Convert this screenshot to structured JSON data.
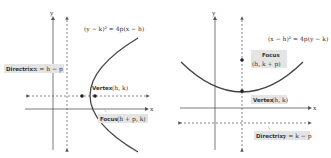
{
  "left_panel": {
    "axis_x": "x",
    "axis_y": "y",
    "equation": "(y − k)² = 4p(x − h)",
    "directrix_label": "Directrix:",
    "directrix_eq": "x = h − p",
    "vertex_label": "Vertex",
    "vertex_coords": "(h, k)",
    "focus_label": "Focus",
    "focus_coords": "(h + p, k)"
  },
  "right_panel": {
    "axis_x": "x",
    "axis_y": "y",
    "equation": "(x − h)² = 4p(y − k)",
    "focus_label": "Focus",
    "focus_coords": "(h, k + p)",
    "vertex_label": "Vertex",
    "vertex_coords": "(h, k)",
    "directrix_label": "Directrix:",
    "directrix_eq": "y = k − p"
  },
  "colors": {
    "curve": "#444444",
    "axis": "#555555",
    "label_box": "#e4e4e4"
  }
}
